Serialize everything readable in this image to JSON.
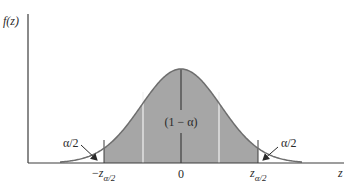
{
  "chart_data": {
    "type": "area",
    "title": "",
    "xlabel": "z",
    "ylabel": "f(z)",
    "tick_labels": [
      "-z_{α/2}",
      "0",
      "z_{α/2}"
    ],
    "annotations": [
      {
        "text": "(1 − α)",
        "position": "center of shaded area"
      },
      {
        "text": "α/2",
        "position": "left tail, arrow pointing to tail area"
      },
      {
        "text": "α/2",
        "position": "right tail, arrow pointing to tail area"
      }
    ],
    "shaded_region": {
      "from": "-z_{α/2}",
      "to": "z_{α/2}",
      "area": "1 − α"
    },
    "grid": false,
    "legend": null
  },
  "labels": {
    "y_axis_f": "f",
    "y_axis_arg": "(z)",
    "x_axis": "z",
    "center_area": "(1 − α)",
    "left_tail": "α/2",
    "right_tail": "α/2",
    "tick_zero": "0",
    "tick_neg_minus": "−",
    "tick_z": "z",
    "tick_sub": "α/2"
  },
  "colors": {
    "shade": "#a6a6a6",
    "curve": "#6e6e6e",
    "axis": "#3c3c3c",
    "divider": "#f2f2f2"
  }
}
